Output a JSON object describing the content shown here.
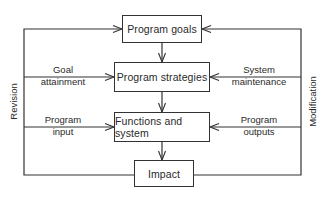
{
  "diagram": {
    "type": "flowchart",
    "boxes": {
      "goals": "Program goals",
      "strategies": "Program strategies",
      "functions": "Functions and system",
      "impact": "Impact"
    },
    "left_labels": {
      "goal_line1": "Goal",
      "goal_line2": "attainment",
      "input_line1": "Program",
      "input_line2": "input"
    },
    "right_labels": {
      "maint_line1": "System",
      "maint_line2": "maintenance",
      "outputs_line1": "Program",
      "outputs_line2": "outputs"
    },
    "side_labels": {
      "left": "Revision",
      "right": "Modification"
    },
    "edges": [
      {
        "from": "Program goals",
        "to": "Program strategies"
      },
      {
        "from": "Program strategies",
        "to": "Functions and system"
      },
      {
        "from": "Functions and system",
        "to": "Impact"
      },
      {
        "from": "Impact",
        "to": "Program goals",
        "via": "Revision (left loop)"
      },
      {
        "from": "Impact",
        "to": "Program strategies",
        "via": "Goal attainment"
      },
      {
        "from": "Impact",
        "to": "Functions and system",
        "via": "Program input"
      },
      {
        "from": "Impact",
        "to": "Program goals",
        "via": "Modification (right loop)"
      },
      {
        "from": "Impact",
        "to": "Program strategies",
        "via": "System maintenance"
      },
      {
        "from": "Impact",
        "to": "Functions and system",
        "via": "Program outputs"
      }
    ]
  }
}
